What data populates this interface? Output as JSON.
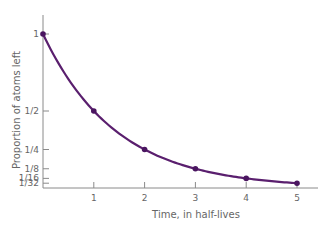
{
  "chart_data": {
    "type": "line",
    "title": "",
    "xlabel": "Time, in half-lives",
    "ylabel": "Proportion of atoms left",
    "x": [
      0,
      1,
      2,
      3,
      4,
      5
    ],
    "values": [
      1,
      0.5,
      0.25,
      0.125,
      0.0625,
      0.03125
    ],
    "x_tick_labels": [
      "1",
      "2",
      "3",
      "4",
      "5"
    ],
    "y_tick_labels": [
      "1",
      "1/2",
      "1/4",
      "1/8",
      "1/16",
      "1/32"
    ],
    "y_tick_values": [
      1,
      0.5,
      0.25,
      0.125,
      0.0625,
      0.03125
    ],
    "xlim": [
      0,
      5.3
    ],
    "ylim": [
      0,
      1.1
    ],
    "grid": false,
    "line_color": "#5a1f6e",
    "marker_color": "#4a1560"
  }
}
